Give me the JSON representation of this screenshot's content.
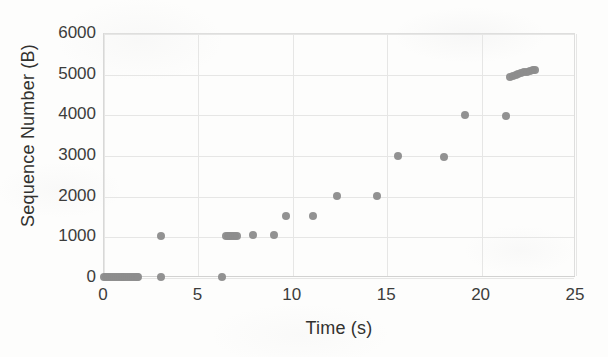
{
  "chart_data": {
    "type": "scatter",
    "title": "",
    "xlabel": "Time (s)",
    "ylabel": "Sequence Number (B)",
    "xlim": [
      0,
      25
    ],
    "ylim": [
      0,
      6000
    ],
    "xticks": [
      0,
      5,
      10,
      15,
      20,
      25
    ],
    "yticks": [
      0,
      1000,
      2000,
      3000,
      4000,
      5000,
      6000
    ],
    "xtick_labels": [
      "0",
      "5",
      "10",
      "15",
      "20",
      "25"
    ],
    "ytick_labels": [
      "0",
      "1000",
      "2000",
      "3000",
      "4000",
      "5000",
      "6000"
    ],
    "grid": "horizontal-and-vertical-light",
    "legend": "none",
    "marker_color": "#8d8d8d",
    "marker_shape": "circle",
    "series": [
      {
        "name": "TCP sequence number",
        "points": [
          [
            0.05,
            0
          ],
          [
            0.16,
            0
          ],
          [
            0.27,
            0
          ],
          [
            0.38,
            0
          ],
          [
            0.48,
            0
          ],
          [
            0.58,
            0
          ],
          [
            0.68,
            0
          ],
          [
            0.78,
            0
          ],
          [
            0.88,
            0
          ],
          [
            0.98,
            0
          ],
          [
            1.08,
            0
          ],
          [
            1.18,
            0
          ],
          [
            1.28,
            0
          ],
          [
            1.38,
            0
          ],
          [
            1.48,
            0
          ],
          [
            1.58,
            0
          ],
          [
            1.68,
            0
          ],
          [
            1.78,
            0
          ],
          [
            1.88,
            0
          ],
          [
            3.05,
            0
          ],
          [
            6.3,
            0
          ],
          [
            3.05,
            1000
          ],
          [
            6.5,
            1000
          ],
          [
            6.6,
            1000
          ],
          [
            6.7,
            1000
          ],
          [
            6.8,
            1000
          ],
          [
            6.9,
            1000
          ],
          [
            7.0,
            1010
          ],
          [
            7.1,
            1010
          ],
          [
            7.95,
            1030
          ],
          [
            9.05,
            1030
          ],
          [
            9.7,
            1500
          ],
          [
            11.1,
            1500
          ],
          [
            12.4,
            2000
          ],
          [
            14.5,
            2000
          ],
          [
            15.6,
            2970
          ],
          [
            18.05,
            2960
          ],
          [
            19.15,
            3980
          ],
          [
            21.35,
            3960
          ],
          [
            21.55,
            4930
          ],
          [
            21.7,
            4950
          ],
          [
            21.85,
            4970
          ],
          [
            22.0,
            4990
          ],
          [
            22.15,
            5010
          ],
          [
            22.3,
            5030
          ],
          [
            22.45,
            5050
          ],
          [
            22.6,
            5070
          ],
          [
            22.75,
            5090
          ],
          [
            22.9,
            5100
          ]
        ]
      }
    ]
  }
}
